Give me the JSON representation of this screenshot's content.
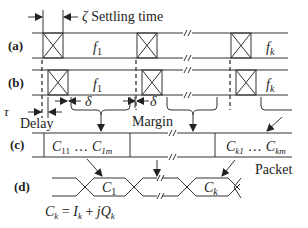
{
  "diagram": {
    "rows": {
      "a": {
        "label": "(a)"
      },
      "b": {
        "label": "(b)"
      },
      "c": {
        "label": "(c)"
      },
      "d": {
        "label": "(d)"
      }
    },
    "settling_time": {
      "symbol": "ζ",
      "text": "Settling time"
    },
    "freq_labels": {
      "first": "f",
      "first_sub": "1",
      "last": "f",
      "last_sub": "k"
    },
    "delay": {
      "symbol": "τ",
      "text": "Delay"
    },
    "delta": "δ",
    "margin": "Margin",
    "packet": "Packet",
    "packet_contents": {
      "first": {
        "start": "C",
        "start_sub": "11",
        "ellipsis": "…",
        "end": "C",
        "end_sub": "1m"
      },
      "last": {
        "start": "C",
        "start_sub": "k1",
        "ellipsis": "…",
        "end": "C",
        "end_sub": "km"
      }
    },
    "symbols": {
      "first": "C",
      "first_sub": "1",
      "last": "C",
      "last_sub": "k"
    },
    "equation": {
      "lhs": "C",
      "lhs_sub": "k",
      "eq": " = ",
      "i": "I",
      "i_sub": "k",
      "plus": " + ",
      "jq": "jQ",
      "q_sub": "k"
    },
    "colors": {
      "line": "#333333",
      "text": "#222222",
      "background": "#ffffff"
    }
  }
}
